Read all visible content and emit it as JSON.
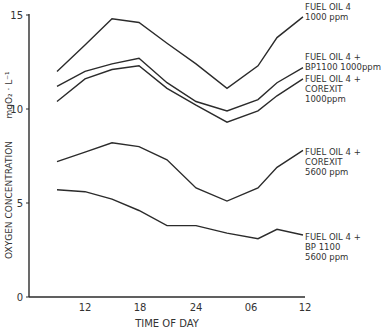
{
  "chart_data": {
    "type": "line",
    "title": "",
    "xlabel": "TIME OF DAY",
    "ylabel": "OXYGEN CONCENTRATION mgO2·L-1",
    "ylim": [
      0,
      15
    ],
    "yticks": [
      0,
      5,
      10,
      15
    ],
    "xtick_labels": [
      "12",
      "18",
      "24",
      "06",
      "12"
    ],
    "grid": false,
    "legend_position": "inline-right",
    "x": [
      "08",
      "12",
      "15",
      "18",
      "21",
      "24",
      "03",
      "07",
      "09",
      "12"
    ],
    "series": [
      {
        "name": "FUEL OIL 4 1000 ppm",
        "label_lines": [
          "FUEL OIL 4",
          "1000 ppm"
        ],
        "values": [
          12.0,
          13.4,
          14.8,
          14.6,
          13.5,
          12.4,
          11.1,
          12.3,
          13.8,
          14.9
        ]
      },
      {
        "name": "FUEL OIL 4 + BP1100 1000ppm",
        "label_lines": [
          "FUEL OIL 4 +",
          "BP1100  1000ppm"
        ],
        "values": [
          11.2,
          12.0,
          12.4,
          12.7,
          11.4,
          10.4,
          9.9,
          10.5,
          11.4,
          12.2
        ]
      },
      {
        "name": "FUEL OIL 4 + COREXIT 1000ppm",
        "label_lines": [
          "FUEL OIL 4 +",
          "COREXIT",
          "1000ppm"
        ],
        "values": [
          10.4,
          11.6,
          12.1,
          12.3,
          11.1,
          10.2,
          9.3,
          9.9,
          10.7,
          11.6
        ]
      },
      {
        "name": "FUEL OIL 4 + COREXIT 5600 ppm",
        "label_lines": [
          "FUEL OIL 4 +",
          "COREXIT",
          "5600 ppm"
        ],
        "values": [
          7.2,
          7.7,
          8.2,
          8.0,
          7.3,
          5.8,
          5.1,
          5.8,
          6.9,
          7.8
        ]
      },
      {
        "name": "FUEL OIL 4 + BP1100 5600 ppm",
        "label_lines": [
          "FUEL OIL 4 +",
          "BP 1100",
          "5600 ppm"
        ],
        "values": [
          5.7,
          5.6,
          5.2,
          4.6,
          3.8,
          3.8,
          3.4,
          3.1,
          3.6,
          3.3
        ]
      }
    ]
  },
  "axis": {
    "y_title": "OXYGEN CONCENTRATION",
    "y_unit": "mgO₂ · L⁻¹",
    "x_title": "TIME OF DAY"
  },
  "style": {
    "line_color": "#2b2b2b",
    "text_color": "#333333"
  }
}
